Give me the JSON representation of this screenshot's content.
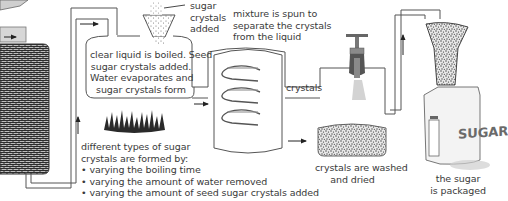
{
  "diagram": {
    "labels": {
      "sugar_crystals_added": [
        "sugar",
        "crystals",
        "added"
      ],
      "boiling_note": [
        "clear liquid is boiled. Seed",
        "sugar crystals added.",
        "Water evaporates and",
        "sugar crystals form"
      ],
      "spin_note": [
        "mixture is spun to",
        "separate the crystals",
        "from the liquid"
      ],
      "crystals": "crystals",
      "washed_note": [
        "crystals are washed",
        "and dried"
      ],
      "packaged_note": [
        "the sugar",
        "is packaged"
      ],
      "types_intro": [
        "different types of sugar",
        "crystals are formed by:"
      ],
      "types_bullets": [
        "varying the boiling time",
        "varying the amount of water removed",
        "varying the amount of seed sugar crystals added"
      ],
      "bag_text": "SUGAR"
    },
    "stages": [
      {
        "id": "filter-tank",
        "description": "tank of filtered liquid (left, cropped)"
      },
      {
        "id": "boiling-pan",
        "description": "clear liquid boiled, seed crystals added"
      },
      {
        "id": "centrifuge",
        "description": "mixture spun to separate crystals"
      },
      {
        "id": "wash-dry",
        "description": "crystals washed and dried"
      },
      {
        "id": "packaging",
        "description": "sugar is packaged"
      }
    ],
    "bullet_glyph": "•",
    "colors": {
      "line": "#555555",
      "text": "#3a3a3a",
      "tap": "#6b6b6b",
      "flame": "#2e2e2e",
      "grain": "#444444"
    }
  }
}
